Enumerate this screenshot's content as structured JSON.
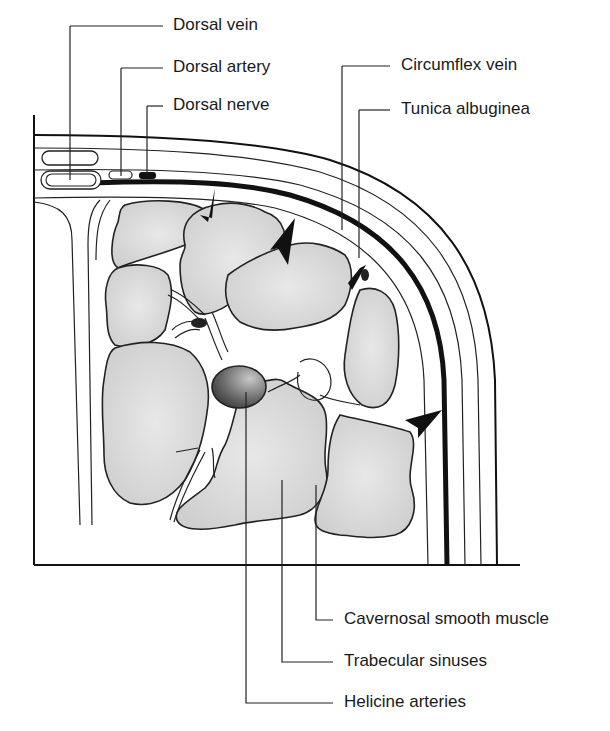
{
  "diagram": {
    "type": "anatomical cross-section",
    "labels_top": [
      {
        "id": "dorsal-vein",
        "text": "Dorsal vein"
      },
      {
        "id": "dorsal-artery",
        "text": "Dorsal artery"
      },
      {
        "id": "dorsal-nerve",
        "text": "Dorsal nerve"
      },
      {
        "id": "circumflex-vein",
        "text": "Circumflex vein"
      },
      {
        "id": "tunica-albuginea",
        "text": "Tunica albuginea"
      }
    ],
    "labels_bottom": [
      {
        "id": "cavernosal-smooth-muscle",
        "text": "Cavernosal smooth muscle"
      },
      {
        "id": "trabecular-sinuses",
        "text": "Trabecular sinuses"
      },
      {
        "id": "helicine-arteries",
        "text": "Helicine arteries"
      }
    ],
    "colors": {
      "line": "#222222",
      "muscle_fill": "#d9d9d9",
      "artery_fill": "#6a6a6a",
      "background": "#ffffff"
    }
  }
}
